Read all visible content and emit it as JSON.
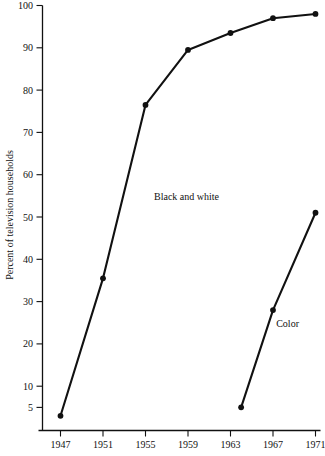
{
  "chart_data": {
    "type": "line",
    "title": "",
    "subtitle": "",
    "xlabel": "",
    "ylabel": "Percent of television households",
    "xlim": [
      1946,
      1971.6
    ],
    "ylim": [
      0,
      100
    ],
    "grid": false,
    "legend_position": "inline-annotation",
    "x_ticks": [
      1947,
      1951,
      1955,
      1959,
      1963,
      1967,
      1971
    ],
    "x_tick_labels": [
      "1947",
      "1951",
      "1955",
      "1959",
      "1963",
      "1967",
      "1971"
    ],
    "y_ticks": [
      5,
      10,
      20,
      30,
      40,
      50,
      60,
      70,
      80,
      90,
      100
    ],
    "y_tick_labels": [
      "5",
      "10",
      "20",
      "30",
      "40",
      "50",
      "60",
      "70",
      "80",
      "90",
      "100"
    ],
    "series": [
      {
        "name": "Black and white",
        "label": "Black and white",
        "color": "#111111",
        "marker": "circle",
        "x": [
          1947,
          1951,
          1955,
          1959,
          1963,
          1967,
          1971
        ],
        "values": [
          3,
          35.5,
          76.5,
          89.5,
          93.5,
          97,
          98
        ]
      },
      {
        "name": "Color",
        "label": "Color",
        "color": "#111111",
        "marker": "circle",
        "x": [
          1964,
          1967,
          1971
        ],
        "values": [
          5,
          28,
          51
        ]
      }
    ],
    "annotations": [
      {
        "text": "Black and white",
        "x": 1955.8,
        "y": 54
      },
      {
        "text": "Color",
        "x": 1967.3,
        "y": 24
      }
    ]
  },
  "axis": {
    "y_title": "Percent of television households"
  },
  "colors": {
    "ink": "#111111",
    "background": "#ffffff"
  }
}
